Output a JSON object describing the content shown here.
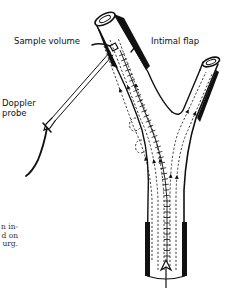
{
  "diagram": {
    "labels": {
      "sample_volume": "Sample volume",
      "intimal_flap": "Intimal flap",
      "doppler_probe_line1": "Doppler",
      "doppler_probe_line2": "probe"
    },
    "caption_fragment": [
      "n in-",
      "d on",
      "urg."
    ],
    "colors": {
      "ink": "#111111",
      "background": "#ffffff"
    }
  }
}
